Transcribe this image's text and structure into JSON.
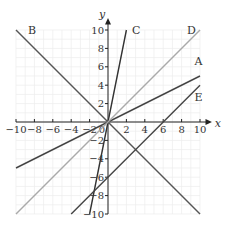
{
  "chart_data": {
    "type": "line",
    "title": "",
    "xlabel": "x",
    "ylabel": "y",
    "xlim": [
      -10,
      10
    ],
    "ylim": [
      -10,
      10
    ],
    "grid": true,
    "x_ticks": [
      -10,
      -8,
      -6,
      -4,
      -2,
      2,
      4,
      6,
      8,
      10
    ],
    "y_ticks": [
      -10,
      -8,
      -6,
      -4,
      -2,
      2,
      4,
      6,
      8,
      10
    ],
    "x_tick_labels": [
      "−10",
      "−8",
      "−6",
      "−4",
      "−2",
      "2",
      "4",
      "6",
      "8",
      "10"
    ],
    "y_tick_labels": [
      "−10",
      "−8",
      "−6",
      "−4",
      "−2",
      "2",
      "4",
      "6",
      "8",
      "10"
    ],
    "origin_label": "0",
    "series": [
      {
        "name": "A",
        "equation": "y = x/2",
        "x": [
          -10,
          10
        ],
        "y": [
          -5,
          5
        ],
        "color": "#444444"
      },
      {
        "name": "B",
        "equation": "y = -x",
        "x": [
          -10,
          10
        ],
        "y": [
          10,
          -10
        ],
        "color": "#555555"
      },
      {
        "name": "C",
        "equation": "y = 5x",
        "x": [
          -2,
          2
        ],
        "y": [
          -10,
          10
        ],
        "color": "#333333"
      },
      {
        "name": "D",
        "equation": "y = x",
        "x": [
          -10,
          10
        ],
        "y": [
          -10,
          10
        ],
        "color": "#aaaaaa"
      },
      {
        "name": "E",
        "equation": "y = x - 6",
        "x": [
          -4,
          10
        ],
        "y": [
          -10,
          4
        ],
        "color": "#444444"
      }
    ]
  },
  "labels": {
    "A": "A",
    "B": "B",
    "C": "C",
    "D": "D",
    "E": "E",
    "x_axis": "x",
    "y_axis": "y"
  }
}
